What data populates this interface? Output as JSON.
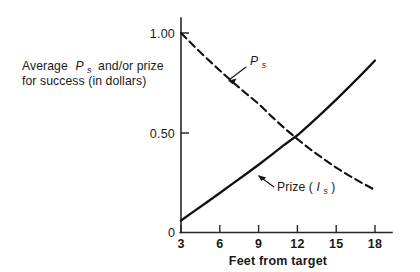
{
  "chart_data": {
    "type": "line",
    "title": "",
    "xlabel": "Feet from target",
    "ylabel": "Average P_s and/or prize for success (in dollars)",
    "ylabel_line1": "Average",
    "ylabel_line1_sym": "P",
    "ylabel_line1_sub": "s",
    "ylabel_line1_rest": "and/or prize",
    "ylabel_line2": "for success (in dollars)",
    "xlim": [
      3,
      18
    ],
    "ylim": [
      0,
      1.08
    ],
    "grid": false,
    "legend": "none",
    "x_ticks": [
      "3",
      "6",
      "9",
      "12",
      "15",
      "18"
    ],
    "x_tick_values": [
      3,
      6,
      9,
      12,
      15,
      18
    ],
    "y_ticks": [
      "0",
      "0.50",
      "1.00"
    ],
    "y_tick_values": [
      0,
      0.5,
      1.0
    ],
    "x": [
      3,
      4,
      5,
      6,
      7,
      8,
      9,
      10,
      11,
      12,
      13,
      14,
      15,
      16,
      17,
      18
    ],
    "series": [
      {
        "name": "P_s",
        "label_symbol": "P",
        "label_subscript": "s",
        "style": "dashed",
        "color": "#101014",
        "values": [
          1.0,
          0.935,
          0.872,
          0.812,
          0.754,
          0.698,
          0.645,
          0.582,
          0.523,
          0.468,
          0.417,
          0.37,
          0.325,
          0.285,
          0.248,
          0.213
        ]
      },
      {
        "name": "Prize (I_s)",
        "label_prefix": "Prize (",
        "label_symbol": "I",
        "label_subscript": "s",
        "label_suffix": ")",
        "style": "solid",
        "color": "#101014",
        "values": [
          0.06,
          0.106,
          0.152,
          0.198,
          0.245,
          0.292,
          0.34,
          0.389,
          0.44,
          0.487,
          0.545,
          0.605,
          0.666,
          0.73,
          0.795,
          0.862
        ]
      }
    ],
    "annotations": [
      {
        "name": "ps-callout",
        "text": "P_s",
        "points_to_series": "P_s",
        "points_to_x": 7.0,
        "points_to_y": 0.735
      },
      {
        "name": "prize-callout",
        "text": "Prize (I_s)",
        "points_to_series": "Prize (I_s)",
        "points_to_x": 9.1,
        "points_to_y": 0.348
      }
    ]
  }
}
